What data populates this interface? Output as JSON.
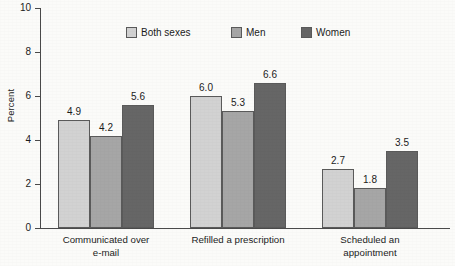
{
  "chart_data": {
    "type": "bar",
    "title": "",
    "subtitle": "",
    "xlabel": "",
    "ylabel": "Percent",
    "ylim": [
      0,
      10
    ],
    "yticks": [
      0,
      2,
      4,
      6,
      8,
      10
    ],
    "ytick_labels": [
      "0",
      "2",
      "4",
      "6",
      "8",
      "10"
    ],
    "grid": false,
    "legend_position": "top-center",
    "categories": [
      "Communicated over\ne-mail",
      "Refilled a prescription",
      "Scheduled an\nappointment"
    ],
    "series": [
      {
        "name": "Both sexes",
        "color": "#d2d2d2",
        "values": [
          4.9,
          6.0,
          2.7
        ],
        "value_labels": [
          "4.9",
          "6.0",
          "2.7"
        ]
      },
      {
        "name": "Men",
        "color": "#a6a6a6",
        "values": [
          4.2,
          5.3,
          1.8
        ],
        "value_labels": [
          "4.2",
          "5.3",
          "1.8"
        ]
      },
      {
        "name": "Women",
        "color": "#666666",
        "values": [
          5.6,
          6.6,
          3.5
        ],
        "value_labels": [
          "5.6",
          "6.6",
          "3.5"
        ]
      }
    ]
  },
  "axes": {
    "y_title": "Percent",
    "y_ticks": [
      {
        "label": "10",
        "value": 10
      },
      {
        "label": "8",
        "value": 8
      },
      {
        "label": "6",
        "value": 6
      },
      {
        "label": "4",
        "value": 4
      },
      {
        "label": "2",
        "value": 2
      },
      {
        "label": "0",
        "value": 0
      }
    ],
    "axis_color": "#4a4a4a"
  },
  "legend": {
    "items": [
      {
        "label": "Both sexes",
        "color": "#d2d2d2"
      },
      {
        "label": "Men",
        "color": "#a6a6a6"
      },
      {
        "label": "Women",
        "color": "#666666"
      }
    ]
  },
  "groups": [
    {
      "label": "Communicated over\ne-mail",
      "bars": [
        {
          "series": "Both sexes",
          "value": 4.9,
          "label": "4.9",
          "color": "#d2d2d2"
        },
        {
          "series": "Men",
          "value": 4.2,
          "label": "4.2",
          "color": "#a6a6a6"
        },
        {
          "series": "Women",
          "value": 5.6,
          "label": "5.6",
          "color": "#666666"
        }
      ]
    },
    {
      "label": "Refilled a prescription",
      "bars": [
        {
          "series": "Both sexes",
          "value": 6.0,
          "label": "6.0",
          "color": "#d2d2d2"
        },
        {
          "series": "Men",
          "value": 5.3,
          "label": "5.3",
          "color": "#a6a6a6"
        },
        {
          "series": "Women",
          "value": 6.6,
          "label": "6.6",
          "color": "#666666"
        }
      ]
    },
    {
      "label": "Scheduled an\nappointment",
      "bars": [
        {
          "series": "Both sexes",
          "value": 2.7,
          "label": "2.7",
          "color": "#d2d2d2"
        },
        {
          "series": "Men",
          "value": 1.8,
          "label": "1.8",
          "color": "#a6a6a6"
        },
        {
          "series": "Women",
          "value": 3.5,
          "label": "3.5",
          "color": "#666666"
        }
      ]
    }
  ]
}
